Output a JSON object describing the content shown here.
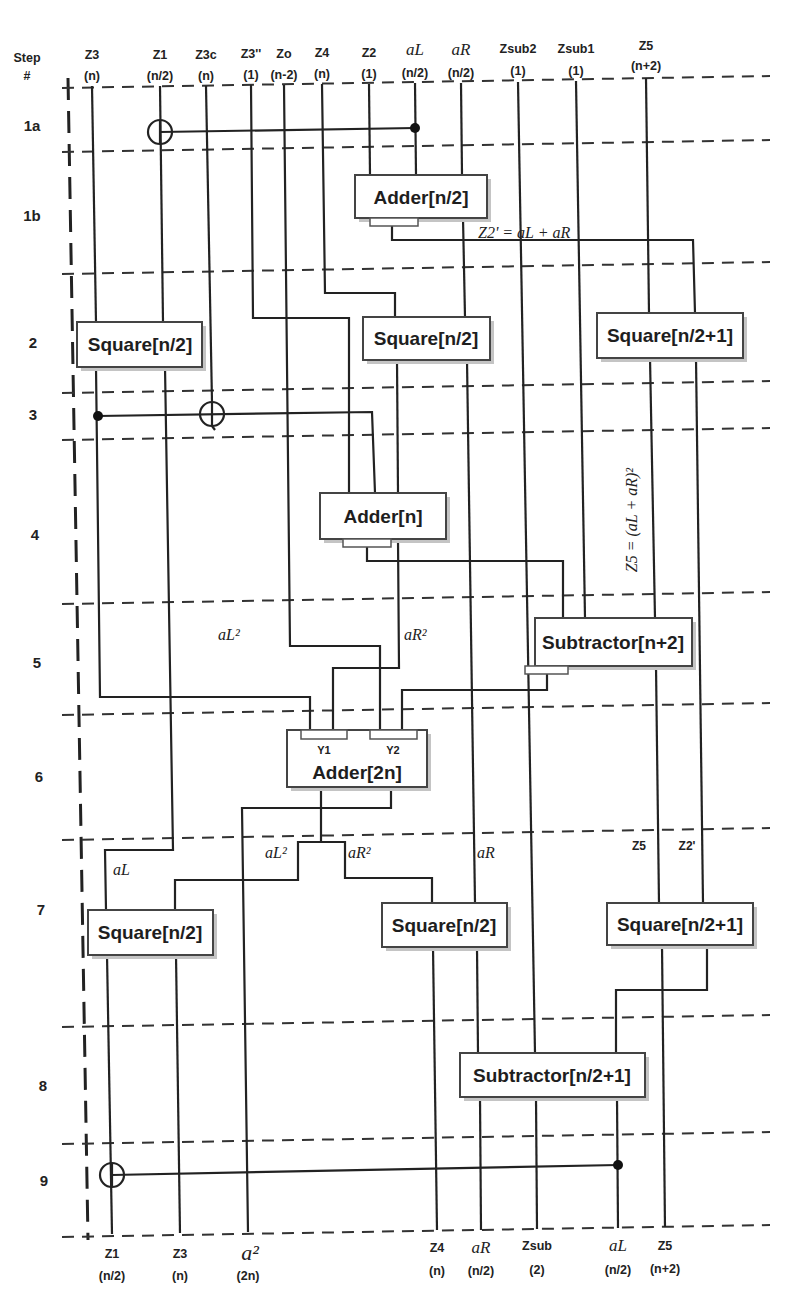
{
  "figure": {
    "step_header": "Step",
    "step_hash": "#"
  },
  "inputs": [
    {
      "name": "Z3",
      "size": "(n)"
    },
    {
      "name": "Z1",
      "size": "(n/2)"
    },
    {
      "name": "Z3c",
      "size": "(n)"
    },
    {
      "name": "Z3''",
      "size": "(1)"
    },
    {
      "name": "Zo",
      "size": "(n-2)"
    },
    {
      "name": "Z4",
      "size": "(n)"
    },
    {
      "name": "Z2",
      "size": "(1)"
    },
    {
      "name": "aL",
      "size": "(n/2)"
    },
    {
      "name": "aR",
      "size": "(n/2)"
    },
    {
      "name": "Zsub2",
      "size": "(1)"
    },
    {
      "name": "Zsub1",
      "size": "(1)"
    },
    {
      "name": "Z5",
      "size": "(n+2)"
    }
  ],
  "outputs": [
    {
      "name": "Z1",
      "size": "(n/2)"
    },
    {
      "name": "Z3",
      "size": "(n)"
    },
    {
      "name": "a²",
      "size": "(2n)"
    },
    {
      "name": "Z4",
      "size": "(n)"
    },
    {
      "name": "aR",
      "size": "(n/2)"
    },
    {
      "name": "Zsub",
      "size": "(2)"
    },
    {
      "name": "aL",
      "size": "(n/2)"
    },
    {
      "name": "Z5",
      "size": "(n+2)"
    }
  ],
  "steps": [
    "1a",
    "1b",
    "2",
    "3",
    "4",
    "5",
    "6",
    "7",
    "8",
    "9"
  ],
  "components": {
    "adder_half": "Adder[n/2]",
    "square_s2_left": "Square[n/2]",
    "square_s2_mid": "Square[n/2]",
    "square_s2_right": "Square[n/2+1]",
    "adder_n": "Adder[n]",
    "subtractor_n2": "Subtractor[n+2]",
    "adder_2n": "Adder[2n]",
    "adder_2n_y1": "Y1",
    "adder_2n_y2": "Y2",
    "square_s7_left": "Square[n/2]",
    "square_s7_mid": "Square[n/2]",
    "square_s7_right": "Square[n/2+1]",
    "subtractor_half1": "Subtractor[n/2+1]"
  },
  "wire_labels": {
    "z2prime_eq": "Z2' = aL + aR",
    "z5_eq": "Z5 = (aL + aR)²",
    "aL2_s5": "aL²",
    "aR2_s5": "aR²",
    "aL_s7": "aL",
    "aL2_s7": "aL²",
    "aR2_s7": "aR²",
    "aR_s7": "aR",
    "z5_s7": "Z5",
    "z2p_s7": "Z2'"
  },
  "colors": {
    "line": "#222222",
    "box_border": "#444444",
    "box_shadow": "#c4c4c4",
    "background": "#ffffff"
  }
}
